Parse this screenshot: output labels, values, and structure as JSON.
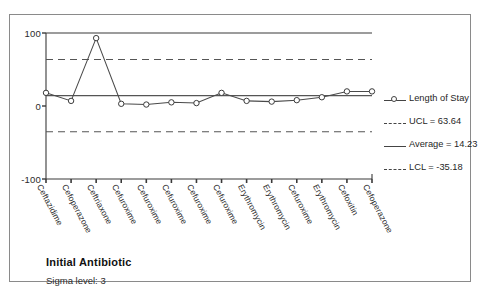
{
  "chart_data": {
    "type": "line",
    "title": "",
    "xlabel": "Initial Antibiotic",
    "ylabel": "",
    "ylim": [
      -100,
      100
    ],
    "yticks": [
      100,
      0,
      -100
    ],
    "ytick_labels": [
      "100",
      "0",
      "-100"
    ],
    "grid": false,
    "legend_position": "right",
    "categories": [
      "Ceftazidime",
      "Cefoperazone",
      "Ceftriaxone",
      "Cefuroxime",
      "Cefuroxime",
      "Cefuroxime",
      "Cefuroxime",
      "Cefuroxime",
      "Erythromycin",
      "Erythromycin",
      "Cefuroxime",
      "Erythromycin",
      "Cefoxitin",
      "Cefoperazone"
    ],
    "series": [
      {
        "name": "Length of Stay",
        "values": [
          18,
          7,
          93,
          3,
          2,
          5,
          4,
          18,
          7,
          6,
          8,
          12,
          20,
          20
        ],
        "marker": "circle",
        "line": "solid"
      }
    ],
    "control_limits": {
      "ucl": 63.64,
      "average": 14.23,
      "lcl": -35.18
    },
    "annotations": {
      "sigma_level": 3
    }
  },
  "axis": {
    "ytick_100": "100",
    "ytick_0": "0",
    "ytick_neg100": "-100"
  },
  "legend": {
    "series_label": "Length of Stay",
    "ucl_label": "UCL = 63.64",
    "average_label": "Average = 14.23",
    "lcl_label": "LCL = -35.18"
  },
  "footer": {
    "axis_title": "Initial Antibiotic",
    "sigma_level": "Sigma level: 3"
  },
  "colors": {
    "line": "#4a4a4a",
    "marker_stroke": "#3a3a3a",
    "marker_fill": "#ffffff",
    "limit_line": "#555555",
    "center_line": "#555555",
    "axis": "#3a3a3a",
    "frame": "#8a8a8a",
    "text": "#1a1a1a"
  }
}
